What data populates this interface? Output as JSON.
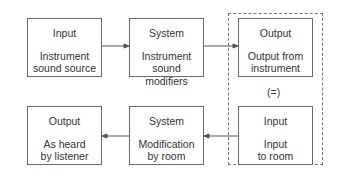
{
  "diagram": {
    "top_row": [
      {
        "title": "Input",
        "desc_line1": "Instrument",
        "desc_line2": "sound source"
      },
      {
        "title": "System",
        "desc_line1": "Instrument",
        "desc_line2": "sound modifiers"
      },
      {
        "title": "Output",
        "desc_line1": "Output from",
        "desc_line2": "instrument"
      }
    ],
    "bottom_row": [
      {
        "title": "Output",
        "desc_line1": "As heard",
        "desc_line2": "by listener"
      },
      {
        "title": "System",
        "desc_line1": "Modification",
        "desc_line2": "by room"
      },
      {
        "title": "Input",
        "desc_line1": "Input",
        "desc_line2": "to room"
      }
    ],
    "equivalence_label": "(=)",
    "line_color": "#555555"
  }
}
